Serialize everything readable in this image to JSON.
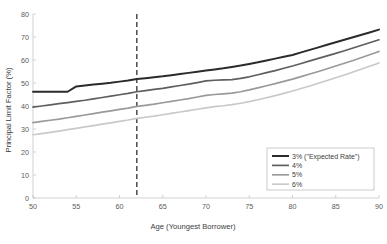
{
  "chart_data": {
    "type": "line",
    "title": "",
    "xlabel": "Age (Youngest Borrower)",
    "ylabel": "Principal Limit Factor (%)",
    "xlim": [
      50,
      90
    ],
    "ylim": [
      0,
      80
    ],
    "xticks": [
      50,
      55,
      60,
      65,
      70,
      75,
      80,
      85,
      90
    ],
    "yticks": [
      0,
      10,
      20,
      30,
      40,
      50,
      60,
      70,
      80
    ],
    "grid": false,
    "legend_position": "lower right",
    "x": [
      50,
      51,
      52,
      53,
      54,
      55,
      56,
      57,
      58,
      59,
      60,
      61,
      62,
      63,
      64,
      65,
      66,
      67,
      68,
      69,
      70,
      71,
      72,
      73,
      74,
      75,
      76,
      77,
      78,
      79,
      80,
      81,
      82,
      83,
      84,
      85,
      86,
      87,
      88,
      89,
      90
    ],
    "series": [
      {
        "name": "3% (\"Expected Rate\")",
        "color": "#2b2b2b",
        "width": 2.0,
        "values": [
          46.2,
          46.2,
          46.2,
          46.2,
          46.2,
          48.5,
          48.9,
          49.3,
          49.7,
          50.1,
          50.6,
          51.1,
          51.7,
          52.1,
          52.5,
          52.9,
          53.4,
          53.9,
          54.4,
          54.9,
          55.4,
          55.9,
          56.4,
          57.0,
          57.6,
          58.3,
          59.0,
          59.8,
          60.6,
          61.4,
          62.2,
          63.3,
          64.4,
          65.5,
          66.6,
          67.7,
          68.8,
          69.9,
          71.0,
          72.1,
          73.2
        ]
      },
      {
        "name": "4%",
        "color": "#5f5f5f",
        "width": 1.7,
        "values": [
          39.5,
          40.0,
          40.5,
          41.0,
          41.5,
          42.0,
          42.5,
          43.1,
          43.7,
          44.3,
          44.9,
          45.5,
          46.2,
          46.7,
          47.2,
          47.7,
          48.3,
          48.9,
          49.5,
          50.2,
          50.9,
          51.2,
          51.4,
          51.5,
          52.0,
          52.7,
          53.6,
          54.5,
          55.4,
          56.4,
          57.4,
          58.5,
          59.6,
          60.7,
          61.8,
          62.9,
          64.0,
          65.2,
          66.4,
          67.6,
          68.8
        ]
      },
      {
        "name": "5%",
        "color": "#9a9a9a",
        "width": 1.7,
        "values": [
          32.8,
          33.3,
          33.8,
          34.3,
          34.9,
          35.5,
          36.1,
          36.7,
          37.3,
          37.9,
          38.5,
          39.1,
          39.8,
          40.3,
          40.8,
          41.4,
          42.0,
          42.6,
          43.2,
          43.9,
          44.6,
          45.0,
          45.3,
          45.6,
          46.2,
          47.0,
          47.9,
          48.8,
          49.7,
          50.7,
          51.7,
          52.8,
          53.9,
          55.0,
          56.2,
          57.4,
          58.6,
          59.8,
          61.1,
          62.4,
          63.7
        ]
      },
      {
        "name": "6%",
        "color": "#c9c9c9",
        "width": 1.7,
        "values": [
          27.5,
          28.0,
          28.5,
          29.1,
          29.7,
          30.3,
          30.9,
          31.5,
          32.1,
          32.7,
          33.3,
          33.9,
          34.6,
          35.1,
          35.6,
          36.2,
          36.8,
          37.4,
          38.0,
          38.6,
          39.2,
          39.7,
          40.1,
          40.6,
          41.2,
          41.9,
          42.7,
          43.6,
          44.5,
          45.5,
          46.5,
          47.6,
          48.7,
          49.9,
          51.1,
          52.3,
          53.5,
          54.8,
          56.1,
          57.4,
          58.7
        ]
      }
    ],
    "annotations": [
      {
        "name": "age-62-reference-line",
        "type": "vline",
        "x": 62,
        "color": "#555555",
        "style": "dashed"
      }
    ]
  }
}
